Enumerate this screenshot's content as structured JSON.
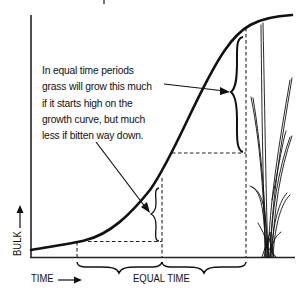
{
  "diagram": {
    "caption_lines": [
      "In equal time periods",
      "grass will grow this much",
      "if it starts high on the",
      "growth curve, but much",
      "less if bitten way down."
    ],
    "x_axis_label": "TIME",
    "y_axis_label": "BULK",
    "interval_label": "EQUAL TIME",
    "elements": {
      "curve": "sigmoid growth curve",
      "plant": "grass tuft illustration",
      "braces": [
        "small growth brace (low start)",
        "large growth brace (high start)",
        "equal time brace 1",
        "equal time brace 2"
      ],
      "arrows": [
        "arrow to large growth brace",
        "arrow to small growth brace",
        "time axis arrow",
        "bulk axis arrow"
      ]
    },
    "colors": {
      "ink": "#111111",
      "background": "#ffffff"
    }
  }
}
